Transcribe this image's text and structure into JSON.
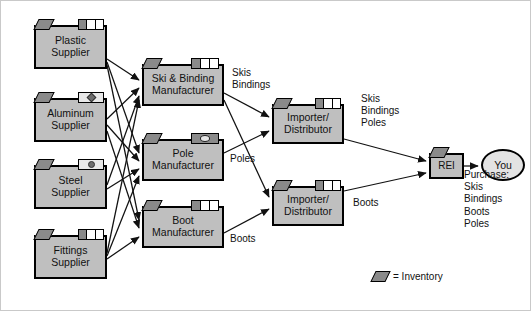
{
  "diagram": {
    "colors": {
      "node_fill": "#bfbfbf",
      "node_border": "#000000",
      "inventory": "#8a8a8a",
      "background": "#ffffff"
    },
    "nodes": [
      {
        "id": "plastic-supplier",
        "label": "Plastic\nSupplier",
        "x": 33,
        "y": 24,
        "w": 73,
        "h": 44,
        "marker": "lines"
      },
      {
        "id": "aluminum-supplier",
        "label": "Aluminum\nSupplier",
        "x": 33,
        "y": 97,
        "w": 73,
        "h": 44,
        "marker": "diamond"
      },
      {
        "id": "steel-supplier",
        "label": "Steel\nSupplier",
        "x": 33,
        "y": 164,
        "w": 73,
        "h": 44,
        "marker": "dot"
      },
      {
        "id": "fittings-supplier",
        "label": "Fittings\nSupplier",
        "x": 33,
        "y": 234,
        "w": 73,
        "h": 44,
        "marker": "lines"
      },
      {
        "id": "ski-binding-mfr",
        "label": "Ski & Binding\nManufacturer",
        "x": 141,
        "y": 63,
        "w": 82,
        "h": 42,
        "marker": "lines"
      },
      {
        "id": "pole-mfr",
        "label": "Pole\nManufacturer",
        "x": 141,
        "y": 138,
        "w": 82,
        "h": 42,
        "marker": "eye"
      },
      {
        "id": "boot-mfr",
        "label": "Boot\nManufacturer",
        "x": 141,
        "y": 205,
        "w": 82,
        "h": 42,
        "marker": "lines"
      },
      {
        "id": "importer-top",
        "label": "Importer/\nDistributor",
        "x": 271,
        "y": 103,
        "w": 72,
        "h": 40,
        "marker": "lines"
      },
      {
        "id": "importer-bottom",
        "label": "Importer/\nDistributor",
        "x": 271,
        "y": 185,
        "w": 72,
        "h": 40,
        "marker": "lines"
      },
      {
        "id": "rei-retailer",
        "label": "REI",
        "x": 428,
        "y": 152,
        "w": 35,
        "h": 26,
        "marker": "none"
      }
    ],
    "consumer": {
      "id": "you",
      "label": "You",
      "x": 480,
      "y": 148,
      "w": 40,
      "h": 28
    },
    "edge_labels": [
      {
        "id": "skis-bindings-to-importer",
        "text": "Skis\nBindings",
        "x": 231,
        "y": 66
      },
      {
        "id": "poles-to-importer",
        "text": "Poles",
        "x": 229,
        "y": 152
      },
      {
        "id": "boots-to-importer",
        "text": "Boots",
        "x": 229,
        "y": 232
      },
      {
        "id": "skis-bindings-poles-to-rei",
        "text": "Skis\nBindings\nPoles",
        "x": 360,
        "y": 92
      },
      {
        "id": "boots-to-rei",
        "text": "Boots",
        "x": 352,
        "y": 196
      },
      {
        "id": "purchase-list",
        "text": "Purchase:\nSkis\nBindings\nBoots\nPoles",
        "x": 463,
        "y": 168
      }
    ],
    "legend": {
      "symbol": "inventory-parallelogram",
      "text": "= Inventory",
      "x": 372,
      "y": 270
    }
  }
}
